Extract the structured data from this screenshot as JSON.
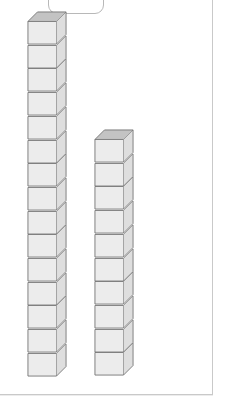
{
  "page": {
    "background_color": "#ffffff",
    "width": 234,
    "height": 409,
    "border_color": "#c9c9c9"
  },
  "top_tab": {
    "shape": "rounded-rectangle",
    "label": "",
    "clipped": "top",
    "border_color": "#b8b8b8",
    "fill_color": "#ffffff"
  },
  "colors": {
    "cube_front": "#ececec",
    "cube_side": "#dedede",
    "cube_top": "#c3c3c3",
    "cube_edge": "#6f6f6f"
  },
  "illustration": {
    "kind": "base-ten-unit-cube-towers",
    "towers": [
      {
        "name": "left-tower",
        "cube_count": 15,
        "top_y": 22,
        "bottom_y": 377,
        "cube_face_height": 23.7,
        "front_left_x": 28,
        "front_width": 30,
        "depth_offset_x": 10,
        "depth_offset_y": 10
      },
      {
        "name": "right-tower",
        "cube_count": 10,
        "top_y": 140,
        "bottom_y": 377,
        "cube_face_height": 23.7,
        "front_left_x": 95,
        "front_width": 30,
        "depth_offset_x": 10,
        "depth_offset_y": 10
      }
    ]
  },
  "chart_data": {
    "type": "bar",
    "title": "",
    "xlabel": "",
    "ylabel": "",
    "categories": [
      "left-tower",
      "right-tower"
    ],
    "values": [
      15,
      10
    ],
    "unit": "unit cubes",
    "grid": false,
    "legend_position": "none"
  }
}
